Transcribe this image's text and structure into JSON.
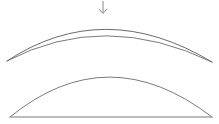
{
  "figure": {
    "canvas": {
      "width": 219,
      "height": 124,
      "background": "#ffffff"
    },
    "stroke_color": "#6b6b6b",
    "arrow_color": "#8a8a8a",
    "shapes": [
      {
        "name": "upper-lens",
        "type": "biconvex-lens",
        "left_tip": [
          7,
          61
        ],
        "right_tip": [
          212,
          62
        ],
        "upper_arc_apex": [
          104,
          16
        ],
        "lower_arc_apex": [
          104,
          29
        ],
        "upper_arc_path": "M 7 61 Q 104 -3 212 62",
        "lower_arc_path": "M 7 61 Q 104 10 212 62"
      },
      {
        "name": "lower-lens",
        "type": "planoconvex-segment",
        "left_end": [
          10,
          117
        ],
        "right_end": [
          212,
          117
        ],
        "arc_apex": [
          108,
          77
        ],
        "arc_path": "M 10 117 Q 108 37 212 117",
        "chord_path": "M 10 117 L 212 117"
      }
    ],
    "annotations": [
      {
        "name": "load-arrow",
        "type": "arrow",
        "direction": "down",
        "shaft_from": [
          103,
          1
        ],
        "shaft_to": [
          103,
          13
        ],
        "head_path": "M 99.5 9.5 L 103 13.5 L 106.5 9.5"
      }
    ]
  }
}
